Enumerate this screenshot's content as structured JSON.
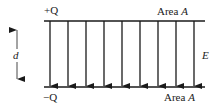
{
  "diagram": {
    "top_plate": {
      "charge_label": "+Q",
      "area_label": "Area",
      "area_symbol": "A"
    },
    "bottom_plate": {
      "charge_label": "−Q",
      "area_label": "Area",
      "area_symbol": "A"
    },
    "separation_label": "d",
    "field_label": "E",
    "field_arrow_count": 9,
    "field_arrow_x": [
      50,
      68,
      86,
      104,
      122,
      140,
      158,
      176,
      194
    ],
    "colors": {
      "line": "#1a1a1a",
      "text": "#222222",
      "background": "#ffffff"
    }
  }
}
